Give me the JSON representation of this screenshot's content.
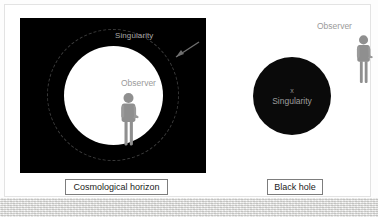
{
  "figure": {
    "title_alt": "Cosmological horizon versus black hole diagram",
    "background_color": "#ffffff",
    "card_border_color": "#e3e3e3"
  },
  "panels": [
    {
      "id": "cosmological-horizon",
      "caption": "Cosmological horizon",
      "background_color": "#000000",
      "labels": {
        "singularity": "Singularity",
        "observer": "Observer"
      },
      "shapes": {
        "dashed_circle_label": "singularity-dashed-boundary",
        "dashed_circle_color": "#3a3a3a",
        "inner_circle_color": "#ffffff"
      },
      "annotation_arrow": {
        "name": "singularity-pointer-arrow",
        "color": "#6e6e6e",
        "points_to": "dashed-circle"
      },
      "figure_icon": {
        "name": "observer-person-icon",
        "color": "#8f8f8f",
        "facing": "right"
      }
    },
    {
      "id": "black-hole",
      "caption": "Black hole",
      "background_color": "#ffffff",
      "labels": {
        "center_marker": "x",
        "singularity": "Singularity",
        "observer": "Observer"
      },
      "shapes": {
        "disk_label": "black-hole-disk",
        "disk_color": "#0a0a0a"
      },
      "figure_icon": {
        "name": "observer-person-icon",
        "color": "#8f8f8f",
        "facing": "right"
      }
    }
  ],
  "colors": {
    "label_gray": "#9a9a9a",
    "dim_gray": "#a8a8a8",
    "caption_border": "#7d7d7d",
    "caption_text": "#1b1b1b",
    "texture_band": "#e8e8e6"
  }
}
